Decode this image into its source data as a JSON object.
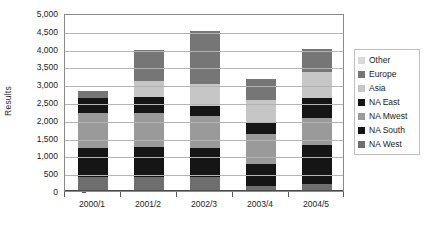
{
  "chart_data": {
    "type": "bar",
    "subtype": "stacked-bar",
    "title": "",
    "xlabel": "",
    "ylabel": "Results",
    "categories": [
      "2000/1",
      "2001/2",
      "2002/3",
      "2003/4",
      "2004/5"
    ],
    "ylim": [
      0,
      5000
    ],
    "ytick_values": [
      0,
      500,
      1000,
      1500,
      2000,
      2500,
      3000,
      3500,
      4000,
      4500,
      5000
    ],
    "ytick_labels": [
      "0",
      "500",
      "1,000",
      "1,500",
      "2,000",
      "2,500",
      "3,000",
      "3,500",
      "4,000",
      "4,500",
      "5,000"
    ],
    "grid": true,
    "grid_axis": "y",
    "legend_position": "right",
    "stack_order_bottom_to_top": [
      "NA West",
      "NA South",
      "NA Mwest",
      "NA East",
      "Asia",
      "Europe",
      "Other"
    ],
    "series": [
      {
        "name": "Other",
        "color": "#d9d9d9",
        "values": [
          0,
          0,
          0,
          0,
          0
        ]
      },
      {
        "name": "Europe",
        "color": "#767676",
        "values": [
          200,
          850,
          1500,
          600,
          650
        ]
      },
      {
        "name": "Asia",
        "color": "#c6c6c6",
        "values": [
          0,
          450,
          600,
          600,
          750
        ]
      },
      {
        "name": "NA East",
        "color": "#151515",
        "values": [
          400,
          450,
          300,
          350,
          550
        ]
      },
      {
        "name": "NA Mwest",
        "color": "#9a9a9a",
        "values": [
          1000,
          950,
          900,
          850,
          750
        ]
      },
      {
        "name": "NA South",
        "color": "#151515",
        "values": [
          800,
          850,
          800,
          600,
          1100
        ]
      },
      {
        "name": "NA West",
        "color": "#6e6e6e",
        "values": [
          400,
          400,
          400,
          150,
          200
        ]
      }
    ],
    "totals": [
      2800,
      3950,
      4500,
      3150,
      4000
    ]
  },
  "legend": {
    "items": [
      {
        "label": "Other",
        "color": "#d9d9d9"
      },
      {
        "label": "Europe",
        "color": "#767676"
      },
      {
        "label": "Asia",
        "color": "#c6c6c6"
      },
      {
        "label": "NA East",
        "color": "#151515"
      },
      {
        "label": "NA Mwest",
        "color": "#9a9a9a"
      },
      {
        "label": "NA South",
        "color": "#151515"
      },
      {
        "label": "NA West",
        "color": "#6e6e6e"
      }
    ]
  }
}
